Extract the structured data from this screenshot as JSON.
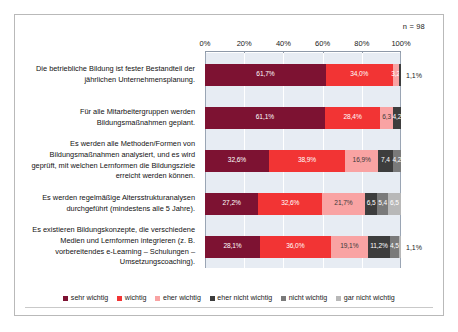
{
  "annotation": {
    "sample_size": "n = 98"
  },
  "chart_data": {
    "type": "bar",
    "orientation": "horizontal",
    "stacked": true,
    "title": "",
    "xlabel": "",
    "ylabel": "",
    "xlim": [
      0,
      100
    ],
    "xticks": [
      "0%",
      "20%",
      "40%",
      "60%",
      "80%",
      "100%"
    ],
    "xtick_values": [
      0,
      20,
      40,
      60,
      80,
      100
    ],
    "grid": true,
    "legend_position": "bottom",
    "categories": [
      "Die betriebliche Bildung ist fester Bestandteil der jährlichen Unternehmensplanung.",
      "Für alle Mitarbeitergruppen werden Bildungsmaßnahmen geplant.",
      "Es werden alle Methoden/Formen von Bildungsmaßnahmen analysiert, und es wird geprüft, mit welchen Lernformen die Bildungsziele erreicht werden können.",
      "Es werden regelmäßige Altersstrukturanalysen durchgeführt (mindestens alle 5 Jahre).",
      "Es existieren Bildungskonzepte, die verschiedene Medien und Lernformen integrieren (z. B. vorbereitendes e-Learning – Schulungen – Umsetzungscoaching)."
    ],
    "series": [
      {
        "name": "sehr wichtig",
        "color": "#7d1232",
        "values": [
          61.7,
          61.1,
          32.6,
          27.2,
          28.1
        ]
      },
      {
        "name": "wichtig",
        "color": "#f23434",
        "values": [
          34.0,
          28.4,
          38.9,
          32.6,
          36.0
        ]
      },
      {
        "name": "eher wichtig",
        "color": "#f9a3a3",
        "values": [
          3.2,
          6.3,
          16.9,
          21.7,
          19.1
        ]
      },
      {
        "name": "eher nicht wichtig",
        "color": "#3d3d3d",
        "values": [
          1.1,
          4.2,
          7.4,
          6.5,
          11.2
        ]
      },
      {
        "name": "nicht wichtig",
        "color": "#7a7a7a",
        "values": [
          0,
          0,
          4.2,
          5.4,
          4.5
        ]
      },
      {
        "name": "gar nicht wichtig",
        "color": "#b8b8b8",
        "values": [
          0,
          0,
          0,
          6.5,
          1.1
        ]
      }
    ],
    "data_labels": [
      [
        {
          "text": "61,7%",
          "inside": true,
          "tone": "light"
        },
        {
          "text": "34,0%",
          "inside": true,
          "tone": "light"
        },
        {
          "text": "3,2",
          "inside": true,
          "tone": "light"
        },
        {
          "text": "1,1%",
          "inside": false,
          "tone": "dark"
        }
      ],
      [
        {
          "text": "61,1%",
          "inside": true,
          "tone": "light"
        },
        {
          "text": "28,4%",
          "inside": true,
          "tone": "light"
        },
        {
          "text": "6,3",
          "inside": true,
          "tone": "dark"
        },
        {
          "text": "4,2",
          "inside": true,
          "tone": "light"
        }
      ],
      [
        {
          "text": "32,6%",
          "inside": true,
          "tone": "light"
        },
        {
          "text": "38,9%",
          "inside": true,
          "tone": "light"
        },
        {
          "text": "16,9%",
          "inside": true,
          "tone": "dark"
        },
        {
          "text": "7,4",
          "inside": true,
          "tone": "light"
        },
        {
          "text": "4,2",
          "inside": true,
          "tone": "light"
        }
      ],
      [
        {
          "text": "27,2%",
          "inside": true,
          "tone": "light"
        },
        {
          "text": "32,6%",
          "inside": true,
          "tone": "light"
        },
        {
          "text": "21,7%",
          "inside": true,
          "tone": "dark"
        },
        {
          "text": "6,5",
          "inside": true,
          "tone": "light"
        },
        {
          "text": "5,4",
          "inside": true,
          "tone": "light"
        },
        {
          "text": "6,5",
          "inside": true,
          "tone": "light"
        }
      ],
      [
        {
          "text": "28,1%",
          "inside": true,
          "tone": "light"
        },
        {
          "text": "36,0%",
          "inside": true,
          "tone": "light"
        },
        {
          "text": "19,1%",
          "inside": true,
          "tone": "dark"
        },
        {
          "text": "11,2%",
          "inside": true,
          "tone": "light"
        },
        {
          "text": "4,5",
          "inside": true,
          "tone": "light"
        },
        {
          "text": "1,1%",
          "inside": false,
          "tone": "dark"
        }
      ]
    ]
  }
}
